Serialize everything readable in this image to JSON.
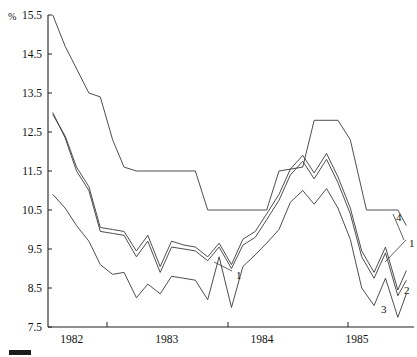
{
  "chart_data": {
    "type": "line",
    "title": "",
    "xlabel": "",
    "ylabel": "%",
    "ylim": [
      7.5,
      15.5
    ],
    "ytick_step": 1.0,
    "ytick_labels": [
      "15.5",
      "14.5",
      "13.5",
      "12.5",
      "11.5",
      "10.5",
      "9.5",
      "8.5",
      "7.5"
    ],
    "ytick_values": [
      15.5,
      14.5,
      13.5,
      12.5,
      11.5,
      10.5,
      9.5,
      8.5,
      7.5
    ],
    "xtick_labels": [
      "1982",
      "1983",
      "1984",
      "1985"
    ],
    "xtick_values": [
      1982,
      1983,
      1984,
      1985
    ],
    "x_axis_label_positions_px": [
      107,
      228,
      348
    ],
    "xlim": [
      1981.75,
      1985.6
    ],
    "grid": false,
    "legend_position": "inline-right",
    "legend_entries": [
      "1",
      "2",
      "3",
      "4"
    ],
    "inline_annotations": [
      {
        "text": "1",
        "x_px": 236,
        "y_px": 279,
        "leader_to_x_px": 214,
        "leader_to_y_px": 262
      },
      {
        "text": "4",
        "x_px": 396,
        "y_px": 221
      },
      {
        "text": "1",
        "x_px": 409,
        "y_px": 247
      },
      {
        "text": "2",
        "x_px": 404,
        "y_px": 294
      },
      {
        "text": "3",
        "x_px": 381,
        "y_px": 313
      }
    ],
    "legend_swatch": {
      "x_px": 9,
      "y_px": 350,
      "width_px": 22,
      "height_px": 5,
      "color": "#1a1a1a"
    },
    "series": [
      {
        "name": "1",
        "x": [
          1981.8,
          1981.93,
          1982.05,
          1982.18,
          1982.3,
          1982.43,
          1982.55,
          1982.68,
          1982.8,
          1982.93,
          1983.05,
          1983.18,
          1983.3,
          1983.43,
          1983.55,
          1983.68,
          1983.8,
          1983.93,
          1984.05,
          1984.18,
          1984.3,
          1984.43,
          1984.55,
          1984.68,
          1984.8,
          1984.93,
          1985.05,
          1985.18,
          1985.3,
          1985.43,
          1985.52
        ],
        "values": [
          12.95,
          12.4,
          11.6,
          11.1,
          10.05,
          10.0,
          9.95,
          9.45,
          9.85,
          9.05,
          9.7,
          9.6,
          9.55,
          9.3,
          9.65,
          9.1,
          9.75,
          9.95,
          10.4,
          10.9,
          11.55,
          11.9,
          11.45,
          11.95,
          11.35,
          10.55,
          9.45,
          8.9,
          9.55,
          8.45,
          8.95
        ]
      },
      {
        "name": "2",
        "x": [
          1981.8,
          1981.93,
          1982.05,
          1982.18,
          1982.3,
          1982.43,
          1982.55,
          1982.68,
          1982.8,
          1982.93,
          1983.05,
          1983.18,
          1983.3,
          1983.43,
          1983.55,
          1983.68,
          1983.8,
          1983.93,
          1984.05,
          1984.18,
          1984.3,
          1984.43,
          1984.55,
          1984.68,
          1984.8,
          1984.93,
          1985.05,
          1985.18,
          1985.3,
          1985.43,
          1985.52
        ],
        "values": [
          13.0,
          12.35,
          11.5,
          11.0,
          9.95,
          9.9,
          9.85,
          9.3,
          9.7,
          8.9,
          9.55,
          9.5,
          9.45,
          9.2,
          9.55,
          9.0,
          9.6,
          9.8,
          10.25,
          10.75,
          11.4,
          11.75,
          11.3,
          11.8,
          11.2,
          10.4,
          9.3,
          8.75,
          9.4,
          8.3,
          8.7
        ]
      },
      {
        "name": "3",
        "x": [
          1981.8,
          1981.93,
          1982.05,
          1982.18,
          1982.3,
          1982.43,
          1982.55,
          1982.68,
          1982.8,
          1982.93,
          1983.05,
          1983.18,
          1983.3,
          1983.43,
          1983.55,
          1983.68,
          1983.8,
          1983.93,
          1984.05,
          1984.18,
          1984.3,
          1984.43,
          1984.55,
          1984.68,
          1984.8,
          1984.93,
          1985.05,
          1985.18,
          1985.3,
          1985.43,
          1985.52
        ],
        "values": [
          10.9,
          10.55,
          10.1,
          9.7,
          9.1,
          8.85,
          8.9,
          8.25,
          8.6,
          8.35,
          8.8,
          8.75,
          8.7,
          8.2,
          9.3,
          8.0,
          9.05,
          9.35,
          9.65,
          10.0,
          10.7,
          11.0,
          10.65,
          11.05,
          10.55,
          9.75,
          8.5,
          8.05,
          8.75,
          7.75,
          8.35
        ]
      },
      {
        "name": "4",
        "x": [
          1981.8,
          1981.93,
          1982.18,
          1982.3,
          1982.43,
          1982.55,
          1982.68,
          1983.3,
          1983.43,
          1984.05,
          1984.18,
          1984.43,
          1984.55,
          1984.8,
          1984.93,
          1985.1,
          1985.3,
          1985.43,
          1985.52
        ],
        "values": [
          15.5,
          14.7,
          13.5,
          13.4,
          12.3,
          11.6,
          11.5,
          11.5,
          10.5,
          10.5,
          11.5,
          11.6,
          12.8,
          12.8,
          12.3,
          10.5,
          10.5,
          10.5,
          10.1
        ]
      }
    ]
  }
}
